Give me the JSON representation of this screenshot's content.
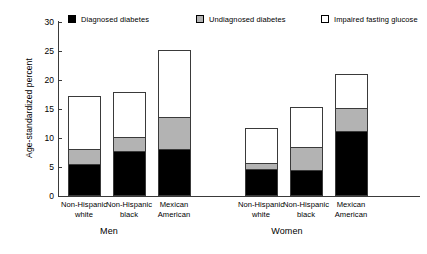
{
  "chart_data": {
    "type": "bar",
    "subtype": "stacked",
    "title": "",
    "xlabel": "",
    "ylabel": "Age-standardized percent",
    "ylim": [
      0,
      30
    ],
    "yticks": [
      0,
      5,
      10,
      15,
      20,
      25,
      30
    ],
    "grid": false,
    "legend_position": "top",
    "groups": [
      {
        "name": "Men",
        "categories": [
          "Non-Hispanic white",
          "Non-Hispanic black",
          "Mexican American"
        ]
      },
      {
        "name": "Women",
        "categories": [
          "Non-Hispanic white",
          "Non-Hispanic black",
          "Mexican American"
        ]
      }
    ],
    "categories": [
      "Non-Hispanic white",
      "Non-Hispanic black",
      "Mexican American",
      "Non-Hispanic white",
      "Non-Hispanic black",
      "Mexican American"
    ],
    "series": [
      {
        "name": "Diagnosed diabetes",
        "color": "#000000",
        "values": [
          5.2,
          7.6,
          7.9,
          4.5,
          4.3,
          11.0
        ]
      },
      {
        "name": "Undiagnosed diabetes",
        "color": "#b3b3b3",
        "values": [
          2.9,
          2.6,
          5.7,
          1.2,
          4.1,
          4.2
        ]
      },
      {
        "name": "Impaired fasting glucose",
        "color": "#ffffff",
        "values": [
          9.1,
          7.6,
          11.4,
          5.9,
          6.9,
          5.8
        ]
      }
    ],
    "cumulative_tops": [
      {
        "diagnosed": 5.2,
        "undiagnosed": 8.1,
        "impaired": 17.2
      },
      {
        "diagnosed": 7.6,
        "undiagnosed": 10.2,
        "impaired": 17.8
      },
      {
        "diagnosed": 7.9,
        "undiagnosed": 13.6,
        "impaired": 25.0
      },
      {
        "diagnosed": 4.5,
        "undiagnosed": 5.7,
        "impaired": 11.6
      },
      {
        "diagnosed": 4.3,
        "undiagnosed": 8.4,
        "impaired": 15.3
      },
      {
        "diagnosed": 11.0,
        "undiagnosed": 15.2,
        "impaired": 21.0
      }
    ]
  },
  "legend": {
    "items": [
      {
        "label": "Diagnosed diabetes",
        "color": "#000000",
        "swatch": "filled-black-square-icon"
      },
      {
        "label": "Undiagnosed diabetes",
        "color": "#b3b3b3",
        "swatch": "filled-gray-square-icon"
      },
      {
        "label": "Impaired fasting glucose",
        "color": "#ffffff",
        "swatch": "open-white-square-icon"
      }
    ]
  },
  "axes": {
    "y": {
      "label": "Age-standardized percent",
      "ticks": [
        "0",
        "5",
        "10",
        "15",
        "20",
        "25",
        "30"
      ]
    },
    "x": {
      "tick_labels": [
        {
          "line1": "Non-Hispanic",
          "line2": "white"
        },
        {
          "line1": "Non-Hispanic",
          "line2": "black"
        },
        {
          "line1": "Mexican",
          "line2": "American"
        },
        {
          "line1": "Non-Hispanic",
          "line2": "white"
        },
        {
          "line1": "Non-Hispanic",
          "line2": "black"
        },
        {
          "line1": "Mexican",
          "line2": "American"
        }
      ],
      "group_labels": [
        "Men",
        "Women"
      ]
    }
  },
  "colors": {
    "diagnosed": "#000000",
    "undiagnosed": "#b3b3b3",
    "impaired": "#ffffff",
    "axis": "#3a3a3a",
    "background": "#ffffff"
  }
}
